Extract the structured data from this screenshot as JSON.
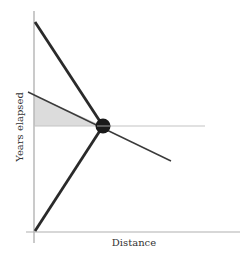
{
  "diagram": {
    "x_axis_label": "Distance",
    "y_axis_label": "Years elapsed",
    "colors": {
      "axis": "#b8b8b8",
      "thick_line": "#2a2a2a",
      "thin_line": "#3a3a3a",
      "reference_line": "#bdbdbd",
      "shade": "#dcdcdc",
      "node": "#1a1a1a"
    },
    "elements": [
      {
        "name": "upper-descending-line",
        "kind": "thick line"
      },
      {
        "name": "lower-ascending-line",
        "kind": "thick line"
      },
      {
        "name": "thin-crossing-line",
        "kind": "thin line"
      },
      {
        "name": "horizontal-reference-line",
        "kind": "grey line"
      },
      {
        "name": "shaded-triangle",
        "kind": "shaded region"
      },
      {
        "name": "intersection-node",
        "kind": "filled circle"
      }
    ]
  }
}
